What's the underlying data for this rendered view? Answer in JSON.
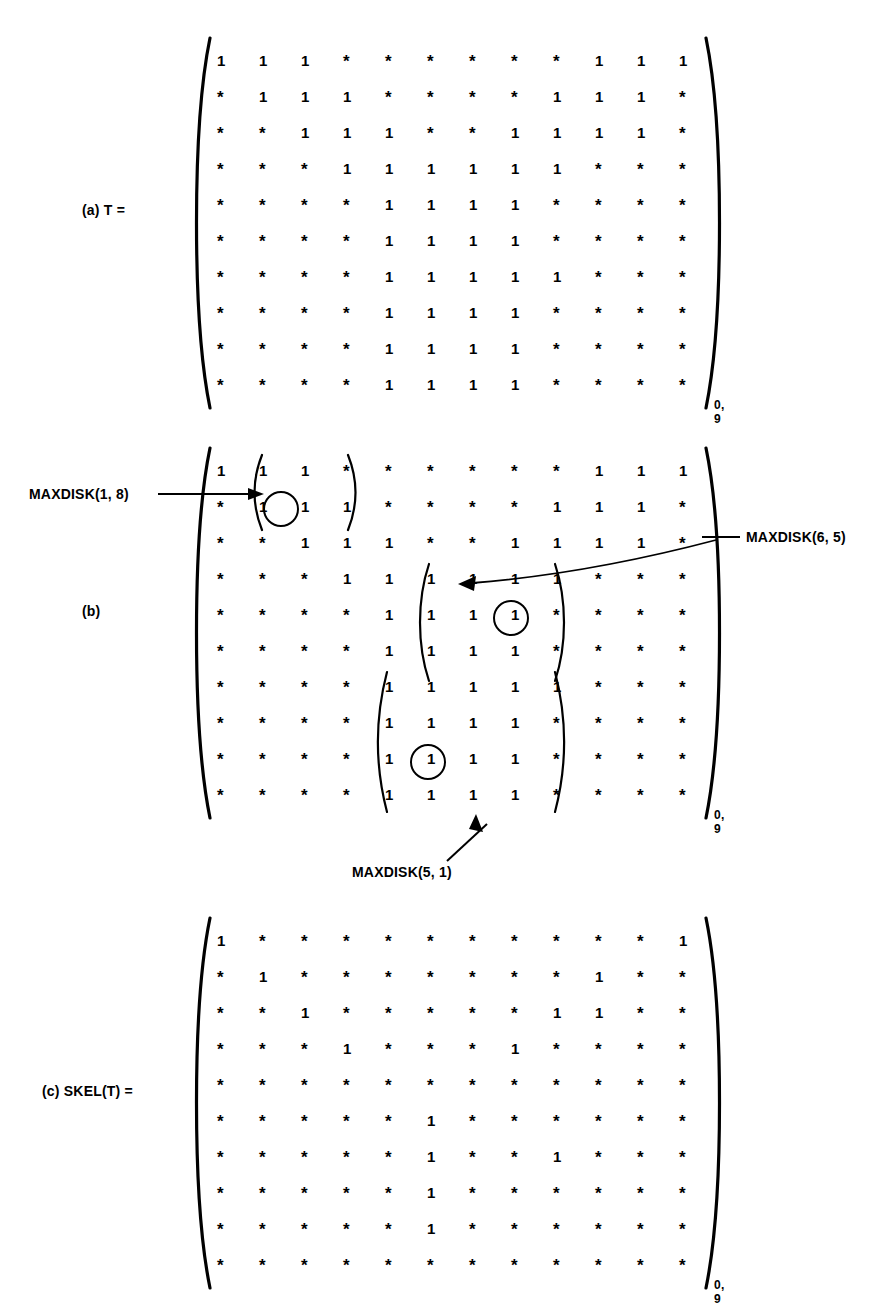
{
  "figure": {
    "background": "#ffffff",
    "ink": "#000000",
    "subscript": "0, 9",
    "parts": [
      {
        "tag": "(a)",
        "name": "T =",
        "label": "(a)   T =",
        "rows": [
          [
            "1",
            "1",
            "1",
            "*",
            "*",
            "*",
            "*",
            "*",
            "*",
            "1",
            "1",
            "1"
          ],
          [
            "*",
            "1",
            "1",
            "1",
            "*",
            "*",
            "*",
            "*",
            "1",
            "1",
            "1",
            "*"
          ],
          [
            "*",
            "*",
            "1",
            "1",
            "1",
            "*",
            "*",
            "1",
            "1",
            "1",
            "1",
            "*"
          ],
          [
            "*",
            "*",
            "*",
            "1",
            "1",
            "1",
            "1",
            "1",
            "1",
            "*",
            "*",
            "*"
          ],
          [
            "*",
            "*",
            "*",
            "*",
            "1",
            "1",
            "1",
            "1",
            "*",
            "*",
            "*",
            "*"
          ],
          [
            "*",
            "*",
            "*",
            "*",
            "1",
            "1",
            "1",
            "1",
            "*",
            "*",
            "*",
            "*"
          ],
          [
            "*",
            "*",
            "*",
            "*",
            "1",
            "1",
            "1",
            "1",
            "1",
            "*",
            "*",
            "*"
          ],
          [
            "*",
            "*",
            "*",
            "*",
            "1",
            "1",
            "1",
            "1",
            "*",
            "*",
            "*",
            "*"
          ],
          [
            "*",
            "*",
            "*",
            "*",
            "1",
            "1",
            "1",
            "1",
            "*",
            "*",
            "*",
            "*"
          ],
          [
            "*",
            "*",
            "*",
            "*",
            "1",
            "1",
            "1",
            "1",
            "*",
            "*",
            "*",
            "*"
          ]
        ]
      },
      {
        "tag": "(b)",
        "name": "",
        "label": "(b)",
        "rows": [
          [
            "1",
            "1",
            "1",
            "*",
            "*",
            "*",
            "*",
            "*",
            "*",
            "1",
            "1",
            "1"
          ],
          [
            "*",
            "1",
            "1",
            "1",
            "*",
            "*",
            "*",
            "*",
            "1",
            "1",
            "1",
            "*"
          ],
          [
            "*",
            "*",
            "1",
            "1",
            "1",
            "*",
            "*",
            "1",
            "1",
            "1",
            "1",
            "*"
          ],
          [
            "*",
            "*",
            "*",
            "1",
            "1",
            "1",
            "1",
            "1",
            "1",
            "*",
            "*",
            "*"
          ],
          [
            "*",
            "*",
            "*",
            "*",
            "1",
            "1",
            "1",
            "1",
            "*",
            "*",
            "*",
            "*"
          ],
          [
            "*",
            "*",
            "*",
            "*",
            "1",
            "1",
            "1",
            "1",
            "*",
            "*",
            "*",
            "*"
          ],
          [
            "*",
            "*",
            "*",
            "*",
            "1",
            "1",
            "1",
            "1",
            "1",
            "*",
            "*",
            "*"
          ],
          [
            "*",
            "*",
            "*",
            "*",
            "1",
            "1",
            "1",
            "1",
            "*",
            "*",
            "*",
            "*"
          ],
          [
            "*",
            "*",
            "*",
            "*",
            "1",
            "1",
            "1",
            "1",
            "*",
            "*",
            "*",
            "*"
          ],
          [
            "*",
            "*",
            "*",
            "*",
            "1",
            "1",
            "1",
            "1",
            "*",
            "*",
            "*",
            "*"
          ]
        ],
        "annotations": [
          {
            "id": "maxdisk-1-8",
            "text": "MAXDISK(1, 8)",
            "center_row": 1,
            "center_col": 1
          },
          {
            "id": "maxdisk-6-5",
            "text": "MAXDISK(6, 5)",
            "center_row": 5,
            "center_col": 6
          },
          {
            "id": "maxdisk-5-1",
            "text": "MAXDISK(5, 1)",
            "center_row": 8,
            "center_col": 5
          }
        ],
        "circled_cells": [
          {
            "row": 1,
            "col": 1
          },
          {
            "row": 5,
            "col": 6
          },
          {
            "row": 8,
            "col": 5
          }
        ],
        "sub_brackets": [
          {
            "id": "disk-1-8",
            "rows": [
              0,
              1
            ],
            "cols": [
              1,
              2
            ]
          },
          {
            "id": "disk-6-5",
            "rows": [
              3,
              5
            ],
            "cols": [
              5,
              7
            ]
          },
          {
            "id": "disk-5-1",
            "rows": [
              6,
              9
            ],
            "cols": [
              4,
              7
            ]
          }
        ]
      },
      {
        "tag": "(c)",
        "name": "SKEL(T) =",
        "label": "(c)   SKEL(T) =",
        "rows": [
          [
            "1",
            "*",
            "*",
            "*",
            "*",
            "*",
            "*",
            "*",
            "*",
            "*",
            "*",
            "1"
          ],
          [
            "*",
            "1",
            "*",
            "*",
            "*",
            "*",
            "*",
            "*",
            "*",
            "1",
            "*",
            "*"
          ],
          [
            "*",
            "*",
            "1",
            "*",
            "*",
            "*",
            "*",
            "*",
            "1",
            "1",
            "*",
            "*"
          ],
          [
            "*",
            "*",
            "*",
            "1",
            "*",
            "*",
            "*",
            "1",
            "*",
            "*",
            "*",
            "*"
          ],
          [
            "*",
            "*",
            "*",
            "*",
            "*",
            "*",
            "*",
            "*",
            "*",
            "*",
            "*",
            "*"
          ],
          [
            "*",
            "*",
            "*",
            "*",
            "*",
            "1",
            "*",
            "*",
            "*",
            "*",
            "*",
            "*"
          ],
          [
            "*",
            "*",
            "*",
            "*",
            "*",
            "1",
            "*",
            "*",
            "1",
            "*",
            "*",
            "*"
          ],
          [
            "*",
            "*",
            "*",
            "*",
            "*",
            "1",
            "*",
            "*",
            "*",
            "*",
            "*",
            "*"
          ],
          [
            "*",
            "*",
            "*",
            "*",
            "*",
            "1",
            "*",
            "*",
            "*",
            "*",
            "*",
            "*"
          ],
          [
            "*",
            "*",
            "*",
            "*",
            "*",
            "*",
            "*",
            "*",
            "*",
            "*",
            "*",
            "*"
          ]
        ]
      }
    ]
  }
}
